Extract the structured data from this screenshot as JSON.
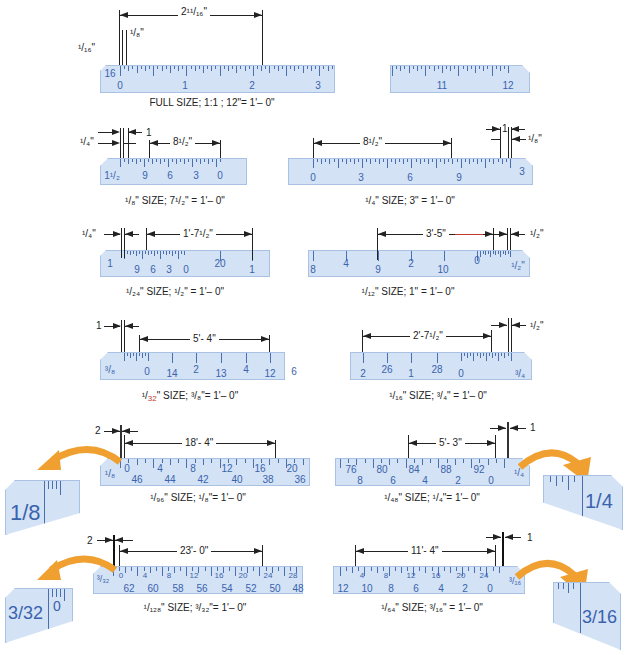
{
  "figure": {
    "copyright": "© Cengage Learning 2014"
  },
  "scales": [
    {
      "id": "full-size",
      "caption": "FULL SIZE; 1:1 ; 12\"= 1'– 0\"",
      "end_label": "16",
      "numbers": [
        "0",
        "1",
        "2",
        "3"
      ],
      "right_numbers": [
        "11",
        "12"
      ],
      "dimensions": [
        "2¹¹/₁₆\"",
        "¹/₁₆\"",
        "¹/₈\""
      ]
    },
    {
      "id": "eighth-size",
      "caption": "¹/₈\" SIZE; 7¹/₂\" = 1'– 0\"",
      "end_label": "1¹/₂",
      "numbers": [
        "9",
        "6",
        "3",
        "0"
      ],
      "dimensions": [
        "¹/₄\"",
        "1",
        "8¹/₂\""
      ]
    },
    {
      "id": "quarter-size",
      "caption": "¹/₄\" SIZE; 3\" = 1'– 0\"",
      "end_label": "3",
      "numbers": [
        "0",
        "3",
        "6",
        "9"
      ],
      "dimensions": [
        "8¹/₂\"",
        "1",
        "¹/₈\""
      ]
    },
    {
      "id": "twentyfourth-size",
      "caption": "¹/₂₄\" SIZE; ¹/₂\" = 1'– 0\"",
      "end_label": "1",
      "numbers": [
        "9",
        "6",
        "3",
        "0",
        "20",
        "1"
      ],
      "dimensions": [
        "¹/₄\"",
        "1'-7¹/₂\""
      ]
    },
    {
      "id": "twelfth-size",
      "caption": "¹/₁₂\" SIZE; 1\" = 1'– 0\"",
      "end_label": "¹/₂\"",
      "numbers": [
        "8",
        "4",
        "9",
        "2",
        "10",
        "0"
      ],
      "dimensions": [
        "3'-5\"",
        "¹/₂\""
      ]
    },
    {
      "id": "thirtysecond-size",
      "caption_prefix": "¹/",
      "caption_red": "32",
      "caption_suffix": "\" SIZE; ³/₈\"= 1'– 0\"",
      "end_label": "³/₈",
      "numbers": [
        "0",
        "14",
        "2",
        "13",
        "4",
        "12",
        "6"
      ],
      "dimensions": [
        "1",
        "5'- 4\""
      ]
    },
    {
      "id": "sixteenth-size",
      "caption": "¹/₁₆\" SIZE; ³/₄\" = 1'– 0\"",
      "end_label": "³/₄",
      "numbers": [
        "2",
        "26",
        "1",
        "28",
        "0"
      ],
      "dimensions": [
        "2'-7¹/₂\"",
        "¹/₂\""
      ]
    },
    {
      "id": "ninetysixth-size",
      "caption": "¹/₉₆\"  SIZE; ¹/₈\"= 1'– 0\"",
      "end_label": "¹/₈",
      "top_numbers": [
        "0",
        "4",
        "8",
        "12",
        "16",
        "20"
      ],
      "bottom_numbers": [
        "46",
        "44",
        "42",
        "40",
        "38",
        "36"
      ],
      "dimensions": [
        "2",
        "18'- 4\""
      ],
      "zoom_label": "1/8"
    },
    {
      "id": "fortyeighth-size",
      "caption": "¹/₄₈\" SIZE; ¹/₄\"= 1'– 0\"",
      "end_label": "¹/₄",
      "top_numbers": [
        "76",
        "80",
        "84",
        "88",
        "92"
      ],
      "bottom_numbers": [
        "8",
        "6",
        "4",
        "2",
        "0"
      ],
      "dimensions": [
        "5'- 3\"",
        "1"
      ],
      "zoom_label": "1/4"
    },
    {
      "id": "onetwentyeighth-size",
      "caption": "¹/₁₂₈\" SIZE; ³/₃₂\"= 1'– 0\"",
      "end_label": "³/₃₂",
      "top_numbers": [
        "0",
        "4",
        "8",
        "12",
        "16",
        "20",
        "24",
        "28"
      ],
      "bottom_numbers": [
        "62",
        "60",
        "58",
        "56",
        "54",
        "52",
        "50",
        "48"
      ],
      "dimensions": [
        "2",
        "23'- 0\""
      ],
      "zoom_label": "3/32",
      "zoom_zero": "0"
    },
    {
      "id": "sixtyfourth-size",
      "caption": "¹/₆₄\" SIZE; ³/₁₆\" = 1'– 0\"",
      "end_label": "³/₁₆",
      "top_numbers": [
        "4",
        "8",
        "12",
        "16",
        "20",
        "24"
      ],
      "bottom_numbers": [
        "12",
        "10",
        "8",
        "6",
        "4",
        "2",
        "0"
      ],
      "dimensions": [
        "11'- 4\"",
        "1"
      ],
      "zoom_label": "3/16"
    }
  ],
  "colors": {
    "ruler_fill": "#d3e2f5",
    "ruler_border": "#a9c1e3",
    "ruler_text": "#3a63ad",
    "arrow_orange": "#f0a030",
    "highlight_red": "#c0392b"
  }
}
